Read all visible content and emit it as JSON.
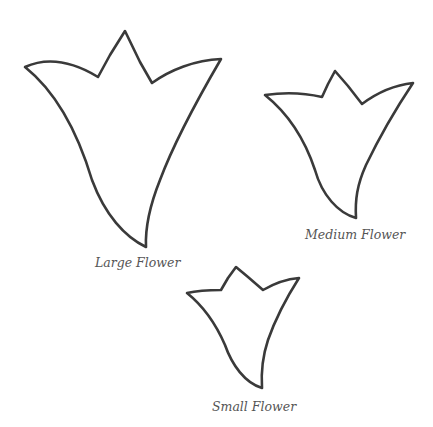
{
  "page": {
    "background": "#ffffff",
    "stroke_color": "#3a3a3a",
    "label_color": "#555555"
  },
  "templates": [
    {
      "id": "large",
      "label": "Large Flower",
      "path": "M25,67 C45,58 70,60 98,77 L110,55 L125,31 L140,62 L152,83 C170,70 195,60 221,59 C200,95 175,140 160,180 C150,205 145,225 146,247 C125,237 105,215 92,180 C80,140 60,95 25,67 Z"
    },
    {
      "id": "medium",
      "label": "Medium Flower",
      "path": "M265,95 C285,92 305,93 322,97 L328,84 L335,71 L348,86 L362,104 C378,92 395,85 413,83 C395,110 378,140 366,165 C357,185 355,200 356,218 C338,213 322,195 315,170 C305,140 290,115 265,95 Z"
    },
    {
      "id": "small",
      "label": "Small Flower",
      "path": "M187,293 C200,290 210,290 221,290 L228,278 L236,267 L248,277 L263,290 C275,283 287,279 299,278 C285,300 275,320 268,340 C263,355 261,372 262,388 C245,383 232,365 225,345 C215,322 202,305 187,293 Z"
    }
  ]
}
